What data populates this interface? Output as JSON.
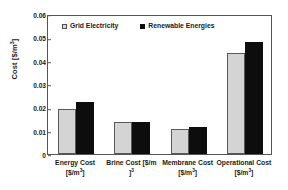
{
  "chart_data": {
    "type": "bar",
    "title": "",
    "xlabel": "",
    "ylabel": "Cost [$/m³]",
    "ylim": [
      0,
      0.06
    ],
    "yticks": [
      0,
      0.01,
      0.02,
      0.03,
      0.04,
      0.05,
      0.06
    ],
    "ytick_labels": [
      "0",
      "0.01",
      "0.02",
      "0.03",
      "0.04",
      "0.05",
      "0.06"
    ],
    "grid": false,
    "legend_position": "upper left inside",
    "categories": [
      "Energy Cost [$/m³]",
      "Brine Cost [$/m³]",
      "Membrane Cost [$/m³]",
      "Operational Cost [$/m³]"
    ],
    "category_lines": [
      {
        "line1": "Energy Cost",
        "line2": "[$/m",
        "sup": "3",
        "line2_end": "]"
      },
      {
        "line1": "Brine Cost [$/m",
        "sup": "3",
        "line2": "]",
        "line2_end": ""
      },
      {
        "line1": "Membrane Cost",
        "line2": "[$/m",
        "sup": "3",
        "line2_end": "]"
      },
      {
        "line1": "Operational Cost",
        "line2": "[$/m",
        "sup": "3",
        "line2_end": "]"
      }
    ],
    "series": [
      {
        "name": "Grid Electricity",
        "color": "#d4d4d4",
        "edge_color": "#595959",
        "values": [
          0.0192,
          0.0137,
          0.0106,
          0.0432
        ]
      },
      {
        "name": "Renewable Energies",
        "color": "#0d0d0d",
        "edge_color": "#0d0d0d",
        "values": [
          0.0222,
          0.0137,
          0.0117,
          0.0478
        ]
      }
    ]
  },
  "legend": {
    "items": [
      {
        "label": "Grid Electricity",
        "swatch": "light-square-marker"
      },
      {
        "label": "Renewable Energies",
        "swatch": "black-square-marker"
      }
    ]
  },
  "axes": {
    "y_title": "Cost [$/m³]"
  }
}
